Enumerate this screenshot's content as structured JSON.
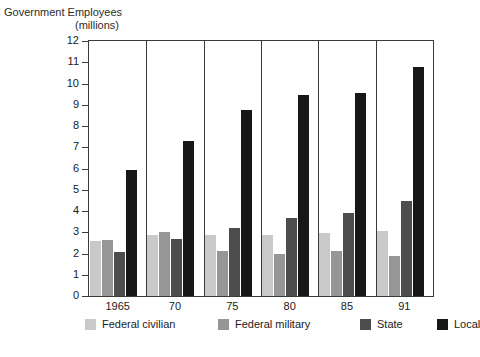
{
  "title": {
    "line1": "Government Employees",
    "line2": "(millions)"
  },
  "chart_data": {
    "type": "bar",
    "title": "Government Employees (millions)",
    "xlabel": "",
    "ylabel": "Government Employees (millions)",
    "categories": [
      "1965",
      "70",
      "75",
      "80",
      "85",
      "91"
    ],
    "series": [
      {
        "name": "Federal civilian",
        "color": "#c9c9c9",
        "values": [
          2.6,
          2.85,
          2.85,
          2.85,
          2.95,
          3.05
        ]
      },
      {
        "name": "Federal military",
        "color": "#969696",
        "values": [
          2.65,
          3.0,
          2.1,
          2.0,
          2.1,
          1.9
        ]
      },
      {
        "name": "State",
        "color": "#4d4d4d",
        "values": [
          2.05,
          2.7,
          3.2,
          3.65,
          3.9,
          4.45
        ]
      },
      {
        "name": "Local",
        "color": "#171717",
        "values": [
          5.95,
          7.3,
          8.75,
          9.45,
          9.55,
          10.8
        ]
      }
    ],
    "ylim": [
      0,
      12
    ],
    "yticks": [
      "0",
      "1",
      "2",
      "3",
      "4",
      "5",
      "6",
      "7",
      "8",
      "9",
      "10",
      "11",
      "12"
    ],
    "grid": false,
    "legend_position": "bottom"
  }
}
